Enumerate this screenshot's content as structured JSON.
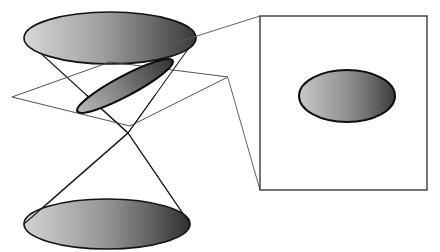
{
  "figure": {
    "title": "Conic section: plane intersecting a double cone with magnified inset of the resulting ellipse",
    "canvas": {
      "width": 440,
      "height": 252,
      "background": "#ffffff"
    },
    "style": {
      "stroke_dark": "#1a1a1a",
      "stroke_thin": "#4d4d4d",
      "stroke_box": "#3b3b3b",
      "gradient_light": "#d9d9d9",
      "gradient_mid": "#9a9a9a",
      "gradient_dark": "#4a4a4a",
      "gradient_darkest": "#2e2e2e",
      "plane_fill": "#ffffff",
      "inset_fill": "#ffffff",
      "outline_width_cone": 1.1,
      "outline_width_plane": 0.9,
      "outline_width_callout": 0.9,
      "outline_width_box": 1.4,
      "ellipse_outline_width": 1.6
    },
    "parts": {
      "upper_cone_base": {
        "label": "Upper nappe base ellipse",
        "cx": 110,
        "cy": 38,
        "rx": 86,
        "ry": 26
      },
      "lower_cone_base": {
        "label": "Lower nappe base ellipse",
        "cx": 107,
        "cy": 224,
        "rx": 83,
        "ry": 25
      },
      "apex": {
        "label": "Cone apex",
        "x": 128,
        "y": 133
      },
      "upper_cone_left_contact": {
        "x": 24,
        "y": 38
      },
      "upper_cone_right_contact": {
        "x": 196,
        "y": 38
      },
      "lower_cone_left_contact": {
        "x": 24,
        "y": 224
      },
      "lower_cone_right_contact": {
        "x": 190,
        "y": 224
      },
      "cutting_plane": {
        "label": "Cutting plane parallelogram",
        "points": "12,97 110,62 228,77 130,126"
      },
      "section_ellipse": {
        "label": "Intersection ellipse (tilted)",
        "cx": 125,
        "cy": 86,
        "rx": 54,
        "ry": 10,
        "rotation_deg": -28
      },
      "inset_box": {
        "label": "Magnification box",
        "x": 260,
        "y": 16,
        "width": 167,
        "height": 174
      },
      "inset_ellipse": {
        "label": "Magnified ellipse",
        "cx": 347,
        "cy": 96,
        "rx": 48,
        "ry": 26
      },
      "callout_upper": {
        "label": "Upper callout line",
        "x1": 178,
        "y1": 42,
        "x2": 260,
        "y2": 16
      },
      "callout_lower": {
        "label": "Lower callout line",
        "x1": 228,
        "y1": 78,
        "x2": 260,
        "y2": 190
      }
    }
  }
}
